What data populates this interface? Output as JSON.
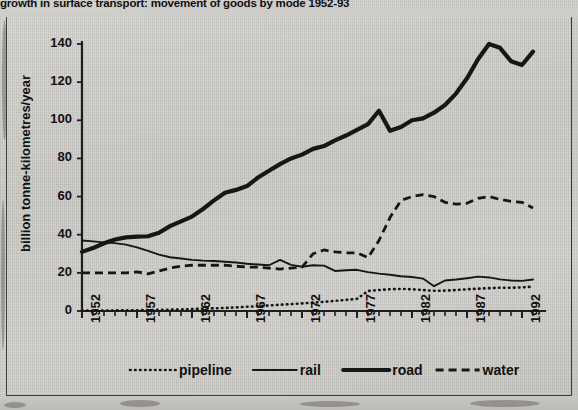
{
  "title": "growth in surface transport: movement of goods by mode 1952-93",
  "axes": {
    "ylabel": "billion tonne-kilometres/year",
    "yticks": [
      "0",
      "20",
      "40",
      "60",
      "80",
      "100",
      "120",
      "140"
    ],
    "xticks": [
      "1952",
      "1957",
      "1962",
      "1967",
      "1972",
      "1977",
      "1982",
      "1987",
      "1992"
    ]
  },
  "legend": {
    "items": [
      {
        "label": "pipeline",
        "style": "dotted"
      },
      {
        "label": "rail",
        "style": "solid-thin"
      },
      {
        "label": "road",
        "style": "solid-thick"
      },
      {
        "label": "water",
        "style": "dashed"
      }
    ]
  },
  "chart_data": {
    "type": "line",
    "title": "growth in surface transport: movement of goods by mode 1952-93",
    "xlabel": "",
    "ylabel": "billion tonne-kilometres/year",
    "xlim": [
      1952,
      1993
    ],
    "ylim": [
      0,
      140
    ],
    "grid": false,
    "legend_position": "bottom",
    "x": [
      1952,
      1953,
      1954,
      1955,
      1956,
      1957,
      1958,
      1959,
      1960,
      1961,
      1962,
      1963,
      1964,
      1965,
      1966,
      1967,
      1968,
      1969,
      1970,
      1971,
      1972,
      1973,
      1974,
      1975,
      1976,
      1977,
      1978,
      1979,
      1980,
      1981,
      1982,
      1983,
      1984,
      1985,
      1986,
      1987,
      1988,
      1989,
      1990,
      1991,
      1992,
      1993
    ],
    "series": [
      {
        "name": "pipeline",
        "style": "dotted",
        "values": [
          0.2,
          0.2,
          0.3,
          0.3,
          0.4,
          0.4,
          0.5,
          0.6,
          0.7,
          0.8,
          1.0,
          1.2,
          1.4,
          1.6,
          1.9,
          2.2,
          2.5,
          2.9,
          3.3,
          3.6,
          4.0,
          4.4,
          4.8,
          5.3,
          5.8,
          6.4,
          10.5,
          11.0,
          11.4,
          11.6,
          11.4,
          11.0,
          10.6,
          10.7,
          11.0,
          11.4,
          11.7,
          12.0,
          12.2,
          12.2,
          12.4,
          12.8
        ]
      },
      {
        "name": "rail",
        "style": "solid-thin",
        "values": [
          37.0,
          36.5,
          36.0,
          35.6,
          34.8,
          33.4,
          31.5,
          29.6,
          28.2,
          27.5,
          26.8,
          26.4,
          26.2,
          25.8,
          25.4,
          24.8,
          24.4,
          24.0,
          26.8,
          24.2,
          23.2,
          24.0,
          23.8,
          21.0,
          21.4,
          21.6,
          20.4,
          19.6,
          19.0,
          18.2,
          17.8,
          17.0,
          13.0,
          16.0,
          16.5,
          17.2,
          18.0,
          17.6,
          16.6,
          16.0,
          15.8,
          16.5
        ]
      },
      {
        "name": "road",
        "style": "solid-thick",
        "values": [
          31.0,
          33.0,
          35.5,
          37.5,
          38.6,
          39.0,
          39.2,
          41.0,
          44.5,
          47.0,
          49.5,
          53.5,
          58.0,
          62.0,
          63.5,
          65.5,
          70.0,
          73.5,
          77.0,
          80.0,
          82.0,
          85.0,
          86.5,
          89.5,
          92.0,
          95.0,
          98.0,
          105.0,
          94.5,
          96.5,
          100.0,
          101.0,
          104.0,
          108.0,
          114.0,
          122.0,
          132.0,
          140.0,
          138.0,
          131.0,
          129.0,
          136.0
        ]
      },
      {
        "name": "water",
        "style": "dashed",
        "values": [
          20.0,
          20.0,
          20.0,
          20.0,
          20.0,
          20.5,
          19.5,
          21.0,
          22.5,
          23.5,
          24.0,
          24.0,
          24.0,
          24.0,
          23.5,
          23.0,
          23.0,
          22.5,
          22.0,
          22.5,
          23.0,
          30.0,
          32.0,
          31.0,
          30.5,
          30.5,
          28.0,
          37.0,
          49.0,
          58.0,
          60.0,
          61.0,
          60.0,
          57.0,
          56.0,
          56.5,
          59.0,
          60.0,
          58.5,
          57.5,
          57.0,
          54.0
        ]
      }
    ]
  }
}
